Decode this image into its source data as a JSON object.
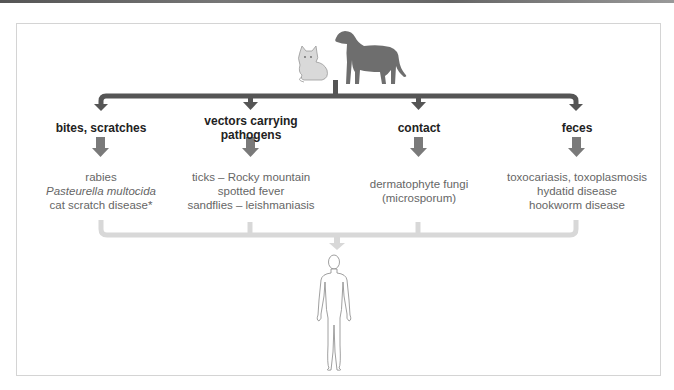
{
  "diagram": {
    "source": "animals (cat and dog)",
    "target": "human",
    "colors": {
      "main_bar": "#555555",
      "category_arrow": "#777777",
      "bracket": "#dddddd",
      "label": "#222222",
      "text": "#666666"
    },
    "routes": [
      {
        "label": "bites, scratches",
        "examples": [
          "rabies",
          "Pasteurella multocida",
          "cat scratch disease*"
        ],
        "italic_index": 1
      },
      {
        "label": "vectors carrying pathogens",
        "label_lines": [
          "vectors carrying",
          "pathogens"
        ],
        "examples": [
          "ticks – Rocky mountain",
          "spotted fever",
          "sandflies – leishmaniasis"
        ]
      },
      {
        "label": "contact",
        "examples": [
          "dermatophyte fungi",
          "(microsporum)"
        ]
      },
      {
        "label": "feces",
        "examples": [
          "toxocariasis, toxoplasmosis",
          "hydatid disease",
          "hookworm disease"
        ]
      }
    ]
  }
}
